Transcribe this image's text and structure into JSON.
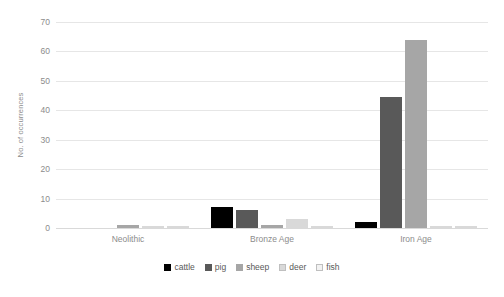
{
  "chart_data": {
    "type": "bar",
    "title": "",
    "subtitle": "",
    "xlabel": "",
    "ylabel": "No. of occurrences",
    "categories": [
      "Neolithic",
      "Bronze Age",
      "Iron Age"
    ],
    "series": [
      {
        "name": "cattle",
        "color": "#000000",
        "values": [
          0,
          7,
          2
        ]
      },
      {
        "name": "pig",
        "color": "#595959",
        "values": [
          0,
          6,
          44.5
        ]
      },
      {
        "name": "sheep",
        "color": "#a6a6a6",
        "values": [
          1,
          1,
          64
        ]
      },
      {
        "name": "deer",
        "color": "#d9d9d9",
        "values": [
          0,
          3,
          0
        ]
      },
      {
        "name": "fish",
        "color": "#f2f2f2",
        "values": [
          0,
          0.5,
          0
        ]
      }
    ],
    "ylim": [
      0,
      70
    ],
    "yticks": [
      0,
      10,
      20,
      30,
      40,
      50,
      60,
      70
    ],
    "grid": "horizontal",
    "legend_position": "bottom"
  },
  "axis": {
    "y_title": "No. of occurrences",
    "y_tick_labels": [
      "0",
      "10",
      "20",
      "30",
      "40",
      "50",
      "60",
      "70"
    ]
  },
  "legend": {
    "items": [
      {
        "label": "cattle"
      },
      {
        "label": "pig"
      },
      {
        "label": "sheep"
      },
      {
        "label": "deer"
      },
      {
        "label": "fish"
      }
    ]
  },
  "colors": {
    "cattle": "#000000",
    "pig": "#595959",
    "sheep": "#a6a6a6",
    "deer": "#d9d9d9",
    "fish": "#f2f2f2",
    "gridline": "#e6e6e6",
    "tick_text": "#8c8c8c",
    "legend_text": "#595959",
    "background": "#ffffff"
  }
}
